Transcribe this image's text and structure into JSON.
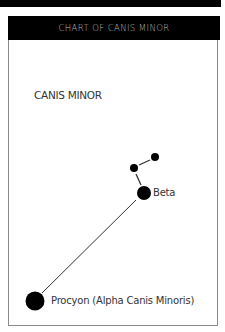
{
  "header": {
    "title": "CHART OF CANIS MINOR"
  },
  "constellation": {
    "name": "CANIS MINOR"
  },
  "stars": [
    {
      "id": "procyon",
      "label": "Procyon (Alpha Canis Minoris)",
      "cx": 35,
      "cy": 301,
      "r": 9.5
    },
    {
      "id": "beta",
      "label": "Beta",
      "cx": 144,
      "cy": 193,
      "r": 7
    },
    {
      "id": "star-3",
      "label": "",
      "cx": 134,
      "cy": 168,
      "r": 4
    },
    {
      "id": "star-4",
      "label": "",
      "cx": 155,
      "cy": 157,
      "r": 4
    }
  ],
  "connections": [
    {
      "from": "procyon",
      "to": "beta"
    },
    {
      "from": "beta",
      "to": "star-3"
    },
    {
      "from": "star-3",
      "to": "star-4"
    }
  ],
  "colors": {
    "header_bg": "#000000",
    "header_text": "#b8b8b8",
    "star": "#000000",
    "line": "#333333",
    "label": "#333333"
  }
}
